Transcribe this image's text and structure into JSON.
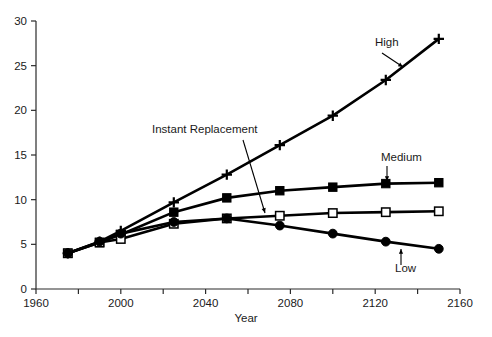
{
  "chart_data": {
    "type": "line",
    "title": "",
    "subtitle": "",
    "xlabel": "Year",
    "ylabel": "",
    "xlim": [
      1960,
      2160
    ],
    "ylim": [
      0,
      30
    ],
    "grid": false,
    "legend_position": "inline-annotations",
    "xticks": [
      1960,
      1980,
      2000,
      2020,
      2040,
      2060,
      2080,
      2100,
      2120,
      2140,
      2160
    ],
    "yticks": [
      0,
      5,
      10,
      15,
      20,
      25,
      30
    ],
    "xtick_labels": [
      "1960",
      "1980",
      "2000",
      "2020",
      "2040",
      "2060",
      "2080",
      "2100",
      "2120",
      "2140",
      "2160"
    ],
    "ytick_labels": [
      "0",
      "5",
      "10",
      "15",
      "20",
      "25",
      "30"
    ],
    "series": [
      {
        "name": "High",
        "marker": "plus",
        "x": [
          1975,
          1990,
          2000,
          2025,
          2050,
          2075,
          2100,
          2125,
          2150
        ],
        "values": [
          4.0,
          5.3,
          6.5,
          9.7,
          12.8,
          16.1,
          19.4,
          23.4,
          28.0
        ]
      },
      {
        "name": "Medium",
        "marker": "filled-square",
        "x": [
          1975,
          1990,
          2000,
          2025,
          2050,
          2075,
          2100,
          2125,
          2150
        ],
        "values": [
          4.0,
          5.2,
          6.1,
          8.6,
          10.2,
          11.0,
          11.4,
          11.8,
          11.9
        ]
      },
      {
        "name": "Instant Replacement",
        "marker": "open-square",
        "x": [
          1975,
          1990,
          2000,
          2025,
          2050,
          2075,
          2100,
          2125,
          2150
        ],
        "values": [
          4.0,
          5.2,
          5.6,
          7.3,
          7.9,
          8.2,
          8.5,
          8.6,
          8.7
        ]
      },
      {
        "name": "Low",
        "marker": "filled-circle",
        "x": [
          1975,
          1990,
          2000,
          2025,
          2050,
          2075,
          2100,
          2125,
          2150
        ],
        "values": [
          4.0,
          5.3,
          6.2,
          7.5,
          7.9,
          7.1,
          6.2,
          5.3,
          4.5
        ]
      }
    ],
    "annotations": [
      {
        "text": "High",
        "label_x": 375,
        "label_y": 46,
        "arrow_from_x": 382,
        "arrow_from_y": 53,
        "arrow_to_x": 403,
        "arrow_to_y": 67
      },
      {
        "text": "Medium",
        "label_x": 381,
        "label_y": 161,
        "arrow_from_x": 387,
        "arrow_from_y": 166,
        "arrow_to_x": 387,
        "arrow_to_y": 181
      },
      {
        "text": "Instant Replacement",
        "label_x": 152,
        "label_y": 133,
        "arrow_from_x": 243,
        "arrow_from_y": 140,
        "arrow_to_x": 265,
        "arrow_to_y": 213
      },
      {
        "text": "Low",
        "label_x": 395,
        "label_y": 272,
        "arrow_from_x": 401,
        "arrow_from_y": 265,
        "arrow_to_x": 401,
        "arrow_to_y": 249
      }
    ],
    "colors": {
      "line": "#000000",
      "axis": "#2b2b2b",
      "text": "#1a1a1a",
      "background": "#ffffff"
    }
  }
}
